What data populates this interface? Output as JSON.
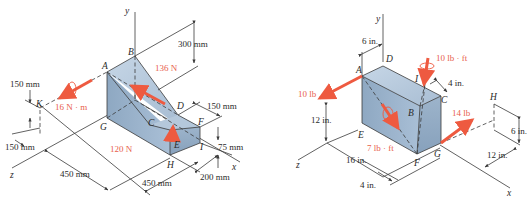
{
  "figures": [
    {
      "id": "left",
      "units": "mm",
      "axes": {
        "x": "x",
        "y": "y",
        "z": "z"
      },
      "points": [
        "A",
        "B",
        "C",
        "D",
        "E",
        "F",
        "G",
        "H",
        "I",
        "K"
      ],
      "forces": [
        {
          "label": "136 N",
          "kind": "force",
          "at": "along slope toward A"
        },
        {
          "label": "120 N",
          "kind": "force",
          "at": "E, vertical up"
        },
        {
          "label": "16 N · m",
          "kind": "couple",
          "at": "K, along z"
        }
      ],
      "dimensions": [
        "300 mm",
        "150 mm",
        "75 mm",
        "200 mm",
        "450 mm",
        "450 mm",
        "150 mm",
        "150 mm"
      ],
      "colors": {
        "body": "#a9bfd6",
        "force": "#ee5a40",
        "line": "#3a3a3a"
      }
    },
    {
      "id": "right",
      "units": "in.",
      "axes": {
        "x": "x",
        "y": "y",
        "z": "z"
      },
      "points": [
        "A",
        "B",
        "C",
        "D",
        "E",
        "F",
        "G",
        "H",
        "I"
      ],
      "forces": [
        {
          "label": "10 lb",
          "kind": "force",
          "at": "A, along +z"
        },
        {
          "label": "10 lb · ft",
          "kind": "couple",
          "at": "I, downward"
        },
        {
          "label": "7 lb · ft",
          "kind": "couple",
          "at": "diagonal AF"
        },
        {
          "label": "14 lb",
          "kind": "force",
          "at": "G toward H"
        }
      ],
      "dimensions": [
        "6 in.",
        "4 in.",
        "12 in.",
        "16 in.",
        "4 in.",
        "6 in.",
        "12 in."
      ],
      "colors": {
        "body": "#a9bfd6",
        "force": "#ee5a40",
        "line": "#3a3a3a"
      }
    }
  ],
  "labels": {
    "left": {
      "y": "y",
      "z": "z",
      "x": "x",
      "A": "A",
      "B": "B",
      "C": "C",
      "D": "D",
      "E": "E",
      "F": "F",
      "G": "G",
      "H": "H",
      "I": "I",
      "K": "K",
      "f136": "136 N",
      "f120": "120 N",
      "m16": "16 N · m",
      "d300": "300 mm",
      "d150a": "150 mm",
      "d75": "75 mm",
      "d200": "200 mm",
      "d450a": "450 mm",
      "d450b": "450 mm",
      "d150k": "150 mm",
      "d150b": "150 mm"
    },
    "right": {
      "y": "y",
      "z": "z",
      "x": "x",
      "A": "A",
      "B": "B",
      "C": "C",
      "D": "D",
      "E": "E",
      "F": "F",
      "G": "G",
      "H": "H",
      "I": "I",
      "f10": "10 lb",
      "m10": "10 lb · ft",
      "m7": "7 lb · ft",
      "f14": "14 lb",
      "d6": "6 in.",
      "d4": "4 in.",
      "d12": "12 in.",
      "d16": "16 in.",
      "d4b": "4 in.",
      "d6h": "6 in.",
      "d12h": "12 in."
    }
  }
}
